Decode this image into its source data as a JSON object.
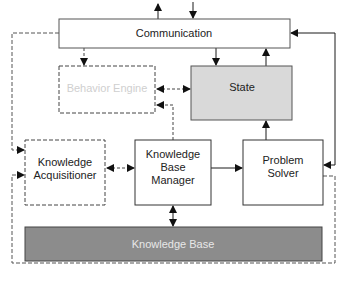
{
  "diagram": {
    "colors": {
      "line": "#1a1a1a",
      "dashed_line": "#666666",
      "state_fill": "#d9d9d9",
      "knowledge_base_fill": "#8c8c8c",
      "box_fill": "#ffffff",
      "faded_text": "#cfcfcf"
    },
    "nodes": [
      {
        "id": "communication",
        "label": "Communication",
        "style": "solid",
        "fill": "#ffffff"
      },
      {
        "id": "behavior_engine",
        "label": "Behavior Engine",
        "style": "dashed",
        "fill": "#ffffff",
        "text": "faded"
      },
      {
        "id": "state",
        "label": "State",
        "style": "solid",
        "fill": "#d9d9d9"
      },
      {
        "id": "knowledge_acquisitioner",
        "label_lines": [
          "Knowledge",
          "Acquisitioner"
        ],
        "style": "dashed",
        "fill": "#ffffff"
      },
      {
        "id": "knowledge_base_manager",
        "label_lines": [
          "Knowledge",
          "Base",
          "Manager"
        ],
        "style": "solid",
        "fill": "#ffffff"
      },
      {
        "id": "problem_solver",
        "label_lines": [
          "Problem",
          "Solver"
        ],
        "style": "solid",
        "fill": "#ffffff"
      },
      {
        "id": "knowledge_base",
        "label": "Knowledge Base",
        "style": "solid",
        "fill": "#8c8c8c",
        "text": "light"
      }
    ],
    "labels": {
      "communication": "Communication",
      "behavior_engine": "Behavior Engine",
      "state": "State",
      "ka_line1": "Knowledge",
      "ka_line2": "Acquisitioner",
      "kbm_line1": "Knowledge",
      "kbm_line2": "Base",
      "kbm_line3": "Manager",
      "ps_line1": "Problem",
      "ps_line2": "Solver",
      "knowledge_base": "Knowledge Base"
    },
    "edges": [
      {
        "from": "communication",
        "to": "external",
        "style": "solid",
        "direction": "out"
      },
      {
        "from": "external",
        "to": "communication",
        "style": "solid",
        "direction": "in"
      },
      {
        "from": "communication",
        "to": "behavior_engine",
        "style": "dashed"
      },
      {
        "from": "communication",
        "to": "state",
        "style": "solid"
      },
      {
        "from": "state",
        "to": "communication",
        "style": "solid"
      },
      {
        "from": "behavior_engine",
        "to": "state",
        "style": "dashed",
        "bidirectional": true
      },
      {
        "from": "knowledge_base_manager",
        "to": "behavior_engine",
        "style": "dashed"
      },
      {
        "from": "communication",
        "to": "knowledge_acquisitioner",
        "style": "dashed"
      },
      {
        "from": "knowledge_acquisitioner",
        "to": "knowledge_base_manager",
        "style": "dashed",
        "bidirectional": true
      },
      {
        "from": "knowledge_base_manager",
        "to": "problem_solver",
        "style": "solid"
      },
      {
        "from": "problem_solver",
        "to": "state",
        "style": "solid"
      },
      {
        "from": "communication",
        "to": "problem_solver",
        "style": "solid",
        "bidirectional": true
      },
      {
        "from": "problem_solver",
        "to": "knowledge_acquisitioner",
        "style": "dashed"
      },
      {
        "from": "knowledge_base_manager",
        "to": "knowledge_base",
        "style": "solid",
        "bidirectional": true
      }
    ]
  }
}
